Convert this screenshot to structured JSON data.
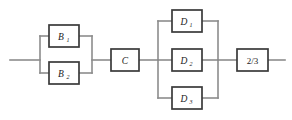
{
  "diagram": {
    "kind": "reliability-block-diagram",
    "background_color": "#ffffff",
    "wire_color": "#8c8c8c",
    "block_border_color": "#3a3a3a",
    "block_fill_color": "#ffffff",
    "text_color": "#1a1a1a",
    "stages": [
      {
        "id": "stage-b",
        "arrangement": "parallel",
        "blocks": [
          {
            "id": "block-b1",
            "base": "B",
            "subscript": "1",
            "full_label": "B1"
          },
          {
            "id": "block-b2",
            "base": "B",
            "subscript": "2",
            "full_label": "B2"
          }
        ]
      },
      {
        "id": "stage-c",
        "arrangement": "series",
        "blocks": [
          {
            "id": "block-c",
            "base": "C",
            "subscript": "",
            "full_label": "C"
          }
        ]
      },
      {
        "id": "stage-d",
        "arrangement": "parallel",
        "blocks": [
          {
            "id": "block-d1",
            "base": "D",
            "subscript": "1",
            "full_label": "D1"
          },
          {
            "id": "block-d2",
            "base": "D",
            "subscript": "2",
            "full_label": "D2"
          },
          {
            "id": "block-d3",
            "base": "D",
            "subscript": "3",
            "full_label": "D3"
          }
        ]
      },
      {
        "id": "stage-voter",
        "arrangement": "series",
        "blocks": [
          {
            "id": "block-voter",
            "base": "2/3",
            "subscript": "",
            "full_label": "2/3"
          }
        ]
      }
    ],
    "labels": {
      "b1_base": "B",
      "b1_sub": "1",
      "b2_base": "B",
      "b2_sub": "2",
      "c": "C",
      "d1_base": "D",
      "d1_sub": "1",
      "d2_base": "D",
      "d2_sub": "2",
      "d3_base": "D",
      "d3_sub": "3",
      "voter": "2/3"
    }
  }
}
